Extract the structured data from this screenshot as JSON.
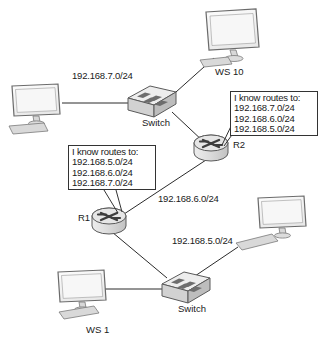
{
  "diagram": {
    "background": "#ffffff",
    "line_color": "#2b2b2b",
    "device_fill": "#e2e2e2",
    "device_stroke": "#5a5a5a",
    "network_labels": [
      {
        "id": "net-7",
        "text": "192.168.7.0/24",
        "x": 72,
        "y": 75
      },
      {
        "id": "net-6",
        "text": "192.168.6.0/24",
        "x": 158,
        "y": 198
      },
      {
        "id": "net-5",
        "text": "192.168.5.0/24",
        "x": 172,
        "y": 240
      }
    ],
    "nodes": [
      {
        "id": "ws-top",
        "type": "workstation",
        "label": "WS 10",
        "label_x": 215,
        "label_y": 72
      },
      {
        "id": "ws-left",
        "type": "workstation",
        "label": "",
        "label_x": 0,
        "label_y": 0
      },
      {
        "id": "ws-right",
        "type": "workstation",
        "label": "",
        "label_x": 0,
        "label_y": 0
      },
      {
        "id": "ws-bottom",
        "type": "workstation",
        "label": "WS 1",
        "label_x": 86,
        "label_y": 330
      },
      {
        "id": "switch-top",
        "type": "switch",
        "label": "Switch",
        "label_x": 142,
        "label_y": 122
      },
      {
        "id": "switch-bottom",
        "type": "switch",
        "label": "Switch",
        "label_x": 178,
        "label_y": 308
      },
      {
        "id": "router-r2",
        "type": "router",
        "label": "R2",
        "label_x": 233,
        "label_y": 145
      },
      {
        "id": "router-r1",
        "type": "router",
        "label": "R1",
        "label_x": 78,
        "label_y": 218
      }
    ],
    "callouts": [
      {
        "id": "callout-r2",
        "target": "R2",
        "x": 230,
        "y": 91,
        "width": 88,
        "height": 45,
        "lines": [
          "I know routes to:",
          "192.168.7.0/24",
          "192.168.6.0/24",
          "192.168.5.0/24"
        ]
      },
      {
        "id": "callout-r1",
        "target": "R1",
        "x": 68,
        "y": 145,
        "width": 88,
        "height": 45,
        "lines": [
          "I know routes to:",
          "192.168.5.0/24",
          "192.168.6.0/24",
          "192.168.7.0/24"
        ]
      }
    ]
  }
}
